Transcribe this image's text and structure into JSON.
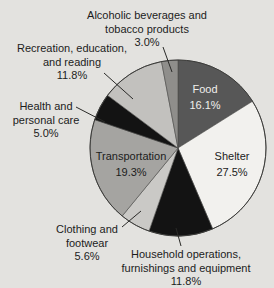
{
  "page": {
    "background": "#e3e2df"
  },
  "chart_data": {
    "type": "pie",
    "title": "",
    "unit": "%",
    "legend": "none",
    "center": {
      "x": 178,
      "y": 148
    },
    "radius": 88,
    "start_angle_deg": 0,
    "direction": "clockwise",
    "outline_color": "#3c3c3a",
    "slice_stroke": "#4a4a48",
    "label_color": "#1c1c1c",
    "leader_color": "#2a2a28",
    "categories": [
      "Food",
      "Shelter",
      "Household operations, furnishings and equipment",
      "Clothing and footwear",
      "Transportation",
      "Health and personal care",
      "Recreation, education, and reading",
      "Alcoholic beverages and tobacco products"
    ],
    "values": [
      16.1,
      27.5,
      11.8,
      5.6,
      19.3,
      5.0,
      11.8,
      3.0
    ],
    "slices": [
      {
        "id": "food",
        "name": "Food",
        "value": 16.1,
        "color": "#575757",
        "label_inside": true,
        "label_color": "#f0efec",
        "label_lines": [
          "Food",
          "16.1%"
        ],
        "label_x": 205,
        "label_y": 93
      },
      {
        "id": "shelter",
        "name": "Shelter",
        "value": 27.5,
        "color": "#f2f1ee",
        "label_inside": true,
        "label_lines": [
          "Shelter",
          "27.5%"
        ],
        "label_x": 232,
        "label_y": 160
      },
      {
        "id": "household-operations",
        "name": "Household operations, furnishings and equipment",
        "value": 11.8,
        "color": "#131313",
        "label_inside": false,
        "label_lines": [
          "Household operations,",
          "furnishings and equipment",
          "11.8%"
        ],
        "label_x": 186,
        "label_y": 258,
        "leader": [
          [
            181,
            246
          ],
          [
            176,
            228
          ]
        ]
      },
      {
        "id": "clothing-footwear",
        "name": "Clothing and footwear",
        "value": 5.6,
        "color": "#cac9c6",
        "label_inside": false,
        "label_lines": [
          "Clothing and",
          "footwear",
          "5.6%"
        ],
        "label_x": 87,
        "label_y": 233,
        "leader": [
          [
            122,
            227
          ],
          [
            141,
            211
          ]
        ]
      },
      {
        "id": "transportation",
        "name": "Transportation",
        "value": 19.3,
        "color": "#a5a4a1",
        "label_inside": true,
        "label_lines": [
          "Transportation",
          "19.3%"
        ],
        "label_x": 131,
        "label_y": 160
      },
      {
        "id": "health-personal-care",
        "name": "Health and personal care",
        "value": 5.0,
        "color": "#131313",
        "label_inside": false,
        "label_lines": [
          "Health and",
          "personal care",
          "5.0%"
        ],
        "label_x": 46,
        "label_y": 110,
        "leader": [
          [
            76,
            107
          ],
          [
            105,
            122
          ]
        ]
      },
      {
        "id": "recreation-education-reading",
        "name": "Recreation, education, and reading",
        "value": 11.8,
        "color": "#c2c1be",
        "label_inside": false,
        "label_lines": [
          "Recreation, education,",
          "and reading",
          "11.8%"
        ],
        "label_x": 72,
        "label_y": 52,
        "leader": [
          [
            104,
            73
          ],
          [
            133,
            99
          ]
        ]
      },
      {
        "id": "alcoholic-tobacco",
        "name": "Alcoholic beverages and tobacco products",
        "value": 3.0,
        "color": "#8f8e8b",
        "label_inside": false,
        "label_lines": [
          "Alcoholic beverages and",
          "tobacco products",
          "3.0%"
        ],
        "label_x": 147,
        "label_y": 19,
        "leader": [
          [
            163,
            47
          ],
          [
            172,
            72
          ]
        ]
      }
    ]
  }
}
